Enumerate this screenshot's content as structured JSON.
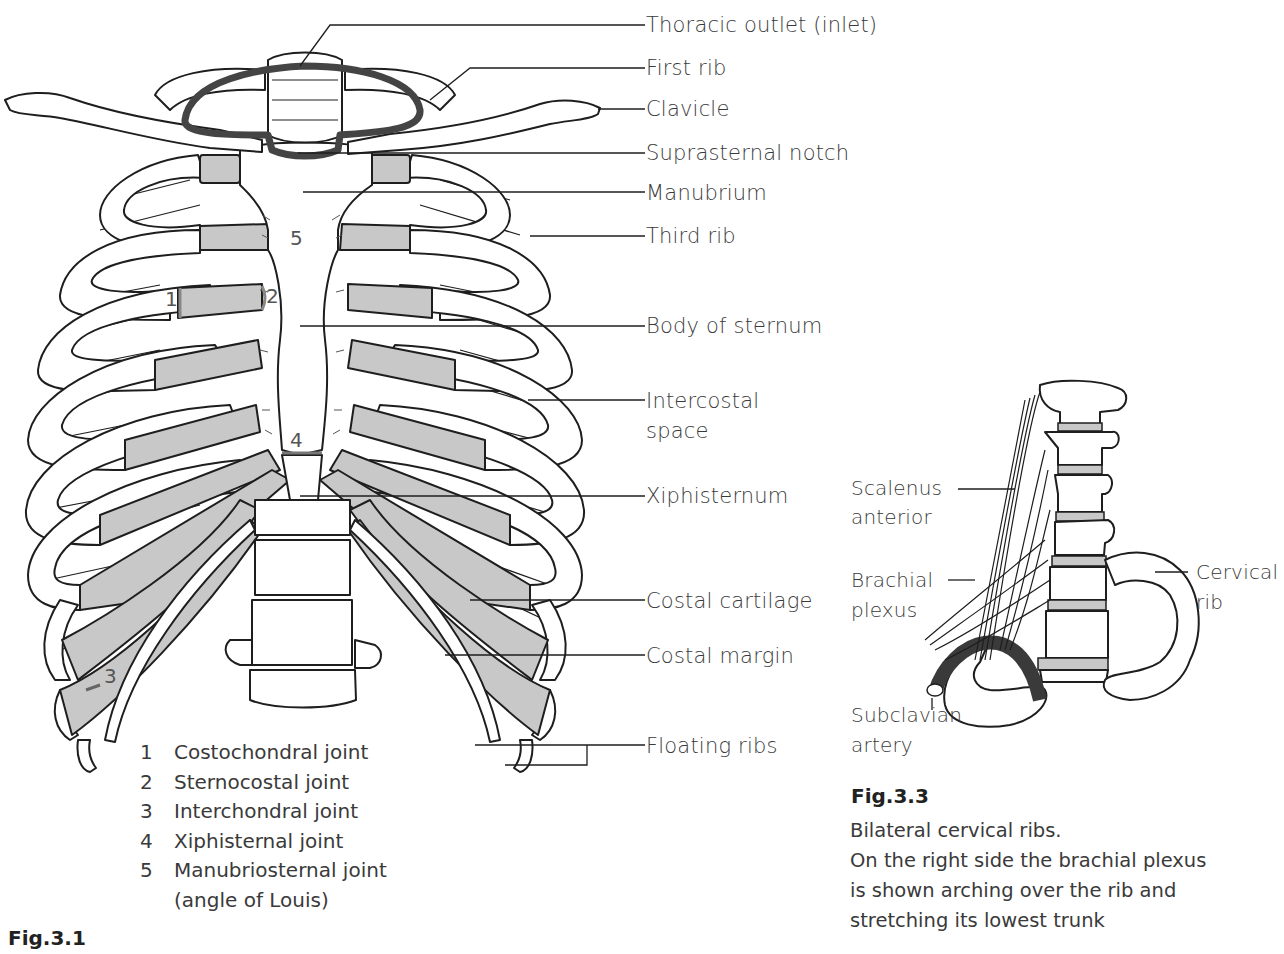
{
  "figure_3_1": {
    "title": "Fig.3.1",
    "labels": {
      "thoracic_outlet": "Thoracic outlet (inlet)",
      "first_rib": "First rib",
      "clavicle": "Clavicle",
      "suprasternal_notch": "Suprasternal notch",
      "manubrium": "Manubrium",
      "third_rib": "Third rib",
      "body_of_sternum": "Body of sternum",
      "intercostal_space_line1": "Intercostal",
      "intercostal_space_line2": "space",
      "xiphisternum": "Xiphisternum",
      "costal_cartilage": "Costal cartilage",
      "costal_margin": "Costal margin",
      "floating_ribs": "Floating ribs"
    },
    "joint_markers": [
      "1",
      "2",
      "3",
      "4",
      "5"
    ],
    "legend": [
      {
        "num": "1",
        "text": "Costochondral joint"
      },
      {
        "num": "2",
        "text": "Sternocostal joint"
      },
      {
        "num": "3",
        "text": "Interchondral joint"
      },
      {
        "num": "4",
        "text": "Xiphisternal joint"
      },
      {
        "num": "5",
        "text": "Manubriosternal joint"
      },
      {
        "num": "",
        "text": "(angle of Louis)"
      }
    ]
  },
  "figure_3_3": {
    "title": "Fig.3.3",
    "labels": {
      "scalenus_line1": "Scalenus",
      "scalenus_line2": "anterior",
      "brachial_line1": "Brachial",
      "brachial_line2": "plexus",
      "subclavian_line1": "Subclavian",
      "subclavian_line2": "artery",
      "cervical_line1": "Cervical",
      "cervical_line2": "rib"
    },
    "caption": [
      "Bilateral cervical ribs.",
      "On the right side the brachial plexus",
      "is shown arching over the rib and",
      "stretching its lowest trunk"
    ]
  },
  "colors": {
    "line": "#1e1e1e",
    "cartilage": "#c8c8c8",
    "outlet_ring": "#444444",
    "artery": "#3a3a3a",
    "text": "#3a3a3a"
  }
}
